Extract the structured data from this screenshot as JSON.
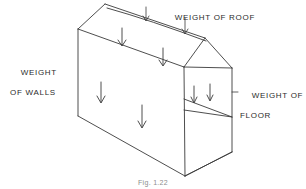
{
  "figure": {
    "caption": "Fig. 1.22",
    "ink_color": "#3a3a3a",
    "text_color": "#2b2b2b",
    "background_color": "#ffffff"
  },
  "labels": {
    "roof": {
      "line1": "WEIGHT OF ROOF"
    },
    "walls": {
      "line1": "WEIGHT",
      "line2": "OF WALLS"
    },
    "floor": {
      "line1": "WEIGHT OF",
      "line2": "FLOOR"
    }
  },
  "diagram": {
    "type": "isometric-line-drawing",
    "load_arrows": {
      "roof": 2,
      "walls": 2,
      "floor": 2,
      "leader_arrows_to_roof": 2
    }
  }
}
